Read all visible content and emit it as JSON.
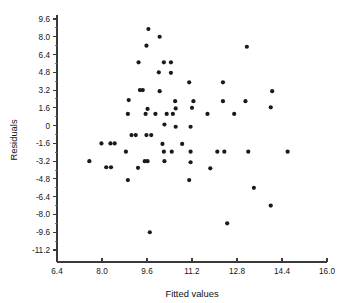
{
  "chart_data": {
    "type": "scatter",
    "title": "",
    "xlabel": "Fitted values",
    "ylabel": "Residuals",
    "xlim": [
      6.4,
      16.0
    ],
    "ylim": [
      -11.2,
      9.6
    ],
    "xticks": [
      6.4,
      8.0,
      9.6,
      11.2,
      12.8,
      14.4,
      16.0
    ],
    "xticklabels": [
      "6.4",
      "8.0",
      "9.6",
      "11.2",
      "12.8",
      "14.4",
      "16.0"
    ],
    "yticks": [
      9.6,
      8.0,
      6.4,
      4.8,
      3.2,
      1.6,
      0,
      -1.6,
      -3.2,
      -4.8,
      -6.4,
      -8.0,
      -9.6,
      -11.2
    ],
    "yticklabels": [
      "9.6",
      "8.0",
      "6.4",
      "4.8",
      "3.2",
      "1.6",
      "0",
      "-1.6",
      "-3.2",
      "-4.8",
      "-6.4",
      "-8.0",
      "-9.6",
      "-11.2"
    ],
    "grid": false,
    "legend": false,
    "minor_ticks": true,
    "marker": "filled-circle",
    "marker_color": "#1a1a1a",
    "marker_size": 2.1,
    "series": [
      {
        "name": "residuals",
        "points": [
          [
            9.65,
            8.7
          ],
          [
            10.05,
            8.0
          ],
          [
            9.58,
            7.2
          ],
          [
            13.15,
            7.1
          ],
          [
            9.3,
            5.7
          ],
          [
            10.2,
            5.7
          ],
          [
            10.45,
            5.7
          ],
          [
            10.02,
            4.8
          ],
          [
            10.45,
            4.75
          ],
          [
            11.1,
            3.9
          ],
          [
            12.3,
            3.9
          ],
          [
            9.35,
            3.2
          ],
          [
            9.45,
            3.2
          ],
          [
            10.05,
            3.1
          ],
          [
            14.05,
            3.1
          ],
          [
            8.95,
            2.3
          ],
          [
            10.6,
            2.2
          ],
          [
            11.25,
            2.2
          ],
          [
            12.3,
            2.2
          ],
          [
            13.1,
            2.2
          ],
          [
            8.92,
            1.05
          ],
          [
            9.55,
            1.05
          ],
          [
            9.9,
            1.05
          ],
          [
            10.3,
            1.05
          ],
          [
            10.52,
            1.05
          ],
          [
            10.62,
            1.55
          ],
          [
            11.2,
            1.6
          ],
          [
            11.75,
            1.05
          ],
          [
            12.7,
            1.05
          ],
          [
            9.62,
            1.5
          ],
          [
            14.0,
            1.65
          ],
          [
            10.22,
            0.1
          ],
          [
            10.62,
            -0.1
          ],
          [
            11.15,
            -0.1
          ],
          [
            9.05,
            -0.85
          ],
          [
            9.2,
            -0.85
          ],
          [
            9.58,
            -0.85
          ],
          [
            9.75,
            -0.85
          ],
          [
            7.98,
            -1.6
          ],
          [
            8.3,
            -1.6
          ],
          [
            8.45,
            -1.6
          ],
          [
            10.15,
            -1.65
          ],
          [
            10.85,
            -1.65
          ],
          [
            8.85,
            -2.35
          ],
          [
            10.2,
            -2.35
          ],
          [
            10.48,
            -2.35
          ],
          [
            11.15,
            -2.35
          ],
          [
            12.1,
            -2.35
          ],
          [
            12.35,
            -2.35
          ],
          [
            13.2,
            -2.35
          ],
          [
            14.6,
            -2.35
          ],
          [
            7.55,
            -3.2
          ],
          [
            9.52,
            -3.2
          ],
          [
            9.62,
            -3.2
          ],
          [
            10.22,
            -3.2
          ],
          [
            11.15,
            -3.3
          ],
          [
            8.15,
            -3.75
          ],
          [
            8.32,
            -3.75
          ],
          [
            9.28,
            -3.8
          ],
          [
            11.85,
            -3.85
          ],
          [
            8.92,
            -4.9
          ],
          [
            11.1,
            -4.9
          ],
          [
            13.4,
            -5.6
          ],
          [
            14.0,
            -7.2
          ],
          [
            12.45,
            -8.8
          ],
          [
            9.7,
            -9.6
          ]
        ]
      }
    ]
  },
  "axis_titles": {
    "x": "Fitted values",
    "y": "Residuals"
  },
  "colors": {
    "axis": "#3a3a3a",
    "marker": "#1a1a1a",
    "background": "#ffffff"
  }
}
